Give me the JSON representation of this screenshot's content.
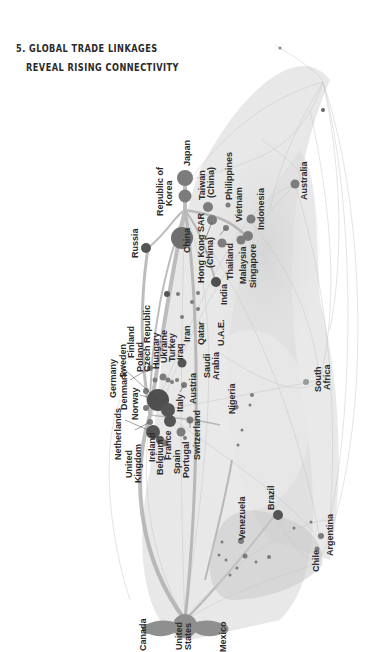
{
  "title": {
    "number": "5.",
    "line1": "5. GLOBAL TRADE LINKAGES",
    "line2": "REVEAL RISING CONNECTIVITY"
  },
  "colors": {
    "background": "#ffffff",
    "edge": "#bdbdbd",
    "edge_strong": "#9a9a9a",
    "node": "#7a7a7a",
    "node_dark": "#4a4a4a",
    "label": "#2b2b2b"
  },
  "diagram": {
    "type": "network",
    "label_orientation": "rotated-90",
    "clusters": [
      "Europe",
      "East Asia",
      "Middle East & South Asia",
      "Africa",
      "South America",
      "North America",
      "Oceania"
    ],
    "nodes": [
      {
        "id": "japan",
        "label": "Japan"
      },
      {
        "id": "korea",
        "label": "Republic of Korea"
      },
      {
        "id": "china",
        "label": "China"
      },
      {
        "id": "taiwan",
        "label": "Taiwan (China)"
      },
      {
        "id": "hongkong",
        "label": "Hong Kong SAR (China)"
      },
      {
        "id": "philippines",
        "label": "Philippines"
      },
      {
        "id": "vietnam",
        "label": "Vietnam"
      },
      {
        "id": "indonesia",
        "label": "Indonesia"
      },
      {
        "id": "thailand",
        "label": "Thailand"
      },
      {
        "id": "malaysia",
        "label": "Malaysia"
      },
      {
        "id": "singapore",
        "label": "Singapore"
      },
      {
        "id": "australia",
        "label": "Australia"
      },
      {
        "id": "india",
        "label": "India"
      },
      {
        "id": "russia",
        "label": "Russia"
      },
      {
        "id": "uae",
        "label": "U.A.E."
      },
      {
        "id": "qatar",
        "label": "Qatar"
      },
      {
        "id": "iran",
        "label": "Iran"
      },
      {
        "id": "iraq",
        "label": "Iraq"
      },
      {
        "id": "saudi",
        "label": "Saudi Arabia"
      },
      {
        "id": "turkey",
        "label": "Turkey"
      },
      {
        "id": "ukraine",
        "label": "Ukraine"
      },
      {
        "id": "hungary",
        "label": "Hungary"
      },
      {
        "id": "czech",
        "label": "Czech Republic"
      },
      {
        "id": "poland",
        "label": "Poland"
      },
      {
        "id": "finland",
        "label": "Finland"
      },
      {
        "id": "sweden",
        "label": "Sweden"
      },
      {
        "id": "germany",
        "label": "Germany"
      },
      {
        "id": "denmark",
        "label": "Denmark"
      },
      {
        "id": "norway",
        "label": "Norway"
      },
      {
        "id": "netherlands",
        "label": "Netherlands"
      },
      {
        "id": "uk",
        "label": "United Kingdom"
      },
      {
        "id": "ireland",
        "label": "Ireland"
      },
      {
        "id": "belgium",
        "label": "Belgium"
      },
      {
        "id": "france",
        "label": "France"
      },
      {
        "id": "spain",
        "label": "Spain"
      },
      {
        "id": "portugal",
        "label": "Portugal"
      },
      {
        "id": "italy",
        "label": "Italy"
      },
      {
        "id": "austria",
        "label": "Austria"
      },
      {
        "id": "switzerland",
        "label": "Switzerland"
      },
      {
        "id": "nigeria",
        "label": "Nigeria"
      },
      {
        "id": "southafrica",
        "label": "South Africa"
      },
      {
        "id": "venezuela",
        "label": "Venezuela"
      },
      {
        "id": "brazil",
        "label": "Brazil"
      },
      {
        "id": "argentina",
        "label": "Argentina"
      },
      {
        "id": "chile",
        "label": "Chile"
      },
      {
        "id": "canada",
        "label": "Canada"
      },
      {
        "id": "us",
        "label": "United States"
      },
      {
        "id": "mexico",
        "label": "Mexico"
      }
    ]
  },
  "labels": {
    "japan": "Japan",
    "korea_1": "Republic of",
    "korea_2": "Korea",
    "china": "China",
    "taiwan_1": "Taiwan",
    "taiwan_2": "(China)",
    "hongkong_1": "Hong Kong SAR",
    "hongkong_2": "(China)",
    "philippines": "Philippines",
    "vietnam": "Vietnam",
    "indonesia": "Indonesia",
    "thailand": "Thailand",
    "malaysia": "Malaysia",
    "singapore": "Singapore",
    "australia": "Australia",
    "india": "India",
    "russia": "Russia",
    "uae": "U.A.E.",
    "qatar": "Qatar",
    "iran": "Iran",
    "iraq": "Iraq",
    "saudi_1": "Saudi",
    "saudi_2": "Arabia",
    "turkey": "Turkey",
    "ukraine": "Ukraine",
    "hungary": "Hungary",
    "czech": "Czech Republic",
    "poland": "Poland",
    "finland": "Finland",
    "sweden": "Sweden",
    "germany": "Germany",
    "denmark": "Denmark",
    "norway": "Norway",
    "netherlands": "Netherlands",
    "uk_1": "United",
    "uk_2": "Kingdom",
    "ireland": "Ireland",
    "belgium": "Belgium",
    "france": "France",
    "spain": "Spain",
    "portugal": "Portugal",
    "italy": "Italy",
    "austria": "Austria",
    "switzerland": "Switzerland",
    "nigeria": "Nigeria",
    "southafrica_1": "South",
    "southafrica_2": "Africa",
    "venezuela": "Venezuela",
    "brazil": "Brazil",
    "argentina": "Argentina",
    "chile": "Chile",
    "canada": "Canada",
    "us_1": "United",
    "us_2": "States",
    "mexico": "Mexico"
  }
}
